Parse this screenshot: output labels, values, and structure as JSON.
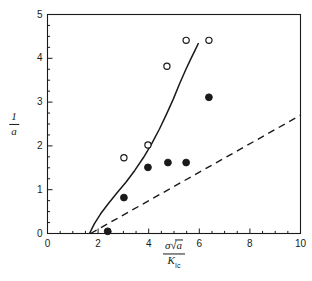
{
  "chart_data": {
    "type": "scatter",
    "title": "",
    "xlabel": "σ√a / K_Ic",
    "ylabel": "1/a",
    "xlim": [
      0,
      10
    ],
    "ylim": [
      0,
      5
    ],
    "xticks": [
      0,
      2,
      4,
      6,
      8,
      10
    ],
    "yticks": [
      0,
      1,
      2,
      3,
      4,
      5
    ],
    "xtick_labels": [
      "0",
      "2",
      "4",
      "6",
      "8",
      "10"
    ],
    "ytick_labels": [
      "0",
      "1",
      "2",
      "3",
      "4",
      "5"
    ],
    "x_minor_step": 0.5,
    "y_minor_step": 0.25,
    "grid": false,
    "legend": "none",
    "series": [
      {
        "name": "open-circles",
        "marker": "open-circle",
        "color": "#1a1a1a",
        "points": [
          {
            "x": 3.02,
            "y": 1.73
          },
          {
            "x": 3.97,
            "y": 2.02
          },
          {
            "x": 4.72,
            "y": 3.82
          },
          {
            "x": 5.48,
            "y": 4.41
          },
          {
            "x": 6.38,
            "y": 4.41
          }
        ]
      },
      {
        "name": "filled-circles",
        "marker": "filled-circle",
        "color": "#1a1a1a",
        "points": [
          {
            "x": 2.38,
            "y": 0.05
          },
          {
            "x": 3.02,
            "y": 0.82
          },
          {
            "x": 3.97,
            "y": 1.51
          },
          {
            "x": 4.76,
            "y": 1.62
          },
          {
            "x": 5.48,
            "y": 1.62
          },
          {
            "x": 6.38,
            "y": 3.11
          }
        ]
      }
    ],
    "curves": [
      {
        "name": "solid-curve",
        "style": "solid",
        "color": "#1a1a1a",
        "points": [
          {
            "x": 1.66,
            "y": 0.0
          },
          {
            "x": 1.85,
            "y": 0.22
          },
          {
            "x": 2.1,
            "y": 0.45
          },
          {
            "x": 2.4,
            "y": 0.68
          },
          {
            "x": 2.75,
            "y": 0.93
          },
          {
            "x": 3.1,
            "y": 1.17
          },
          {
            "x": 3.45,
            "y": 1.44
          },
          {
            "x": 3.8,
            "y": 1.74
          },
          {
            "x": 4.12,
            "y": 2.05
          },
          {
            "x": 4.42,
            "y": 2.38
          },
          {
            "x": 4.7,
            "y": 2.72
          },
          {
            "x": 4.98,
            "y": 3.08
          },
          {
            "x": 5.22,
            "y": 3.42
          },
          {
            "x": 5.45,
            "y": 3.72
          },
          {
            "x": 5.66,
            "y": 3.98
          },
          {
            "x": 5.83,
            "y": 4.18
          },
          {
            "x": 5.97,
            "y": 4.35
          }
        ]
      },
      {
        "name": "dashed-line",
        "style": "dashed",
        "color": "#1a1a1a",
        "points": [
          {
            "x": 1.7,
            "y": 0.0
          },
          {
            "x": 10.0,
            "y": 2.7
          }
        ]
      }
    ]
  },
  "axes": {
    "x_title_numerator_symbol": "σ",
    "x_title_numerator_radicand": "a",
    "x_title_denominator_symbol": "K",
    "x_title_denominator_subscript": "Ic",
    "y_title_numerator": "1",
    "y_title_denominator": "a"
  }
}
